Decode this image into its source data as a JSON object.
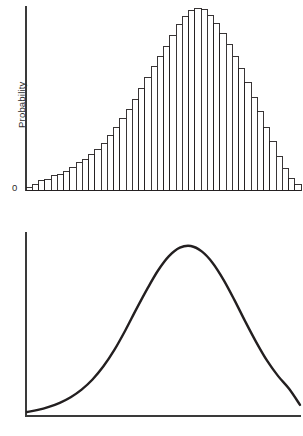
{
  "figure": {
    "background": "#ffffff",
    "ink": "#231f20",
    "panels": [
      {
        "id": "histogram",
        "ylabel": "Probability",
        "origin_label": "0"
      },
      {
        "id": "curve",
        "ylabel": "Probability",
        "origin_label": "0"
      }
    ]
  },
  "chart_data": [
    {
      "type": "bar",
      "title": "",
      "xlabel": "",
      "ylabel": "Probability",
      "grid": false,
      "legend": null,
      "axis": {
        "x_axis_visible": true,
        "y_axis_visible": true,
        "y_tick_labels": [
          "0"
        ],
        "x_tick_labels": []
      },
      "ylim": [
        0,
        1.0
      ],
      "categories": [
        "1",
        "2",
        "3",
        "4",
        "5",
        "6",
        "7",
        "8",
        "9",
        "10",
        "11",
        "12",
        "13",
        "14",
        "15",
        "16",
        "17",
        "18",
        "19",
        "20",
        "21",
        "22",
        "23",
        "24",
        "25",
        "26",
        "27",
        "28",
        "29",
        "30",
        "31",
        "32",
        "33",
        "34",
        "35",
        "36",
        "37",
        "38",
        "39",
        "40",
        "41",
        "42",
        "43",
        "44"
      ],
      "values": [
        0.012,
        0.03,
        0.05,
        0.06,
        0.078,
        0.085,
        0.1,
        0.125,
        0.15,
        0.165,
        0.195,
        0.225,
        0.258,
        0.3,
        0.345,
        0.395,
        0.445,
        0.5,
        0.56,
        0.62,
        0.68,
        0.735,
        0.79,
        0.85,
        0.91,
        0.955,
        0.985,
        1.0,
        0.99,
        0.96,
        0.915,
        0.86,
        0.8,
        0.735,
        0.665,
        0.59,
        0.51,
        0.43,
        0.345,
        0.265,
        0.185,
        0.12,
        0.065,
        0.028
      ]
    },
    {
      "type": "line",
      "title": "",
      "xlabel": "",
      "ylabel": "Probability",
      "grid": false,
      "legend": null,
      "axis": {
        "x_axis_visible": true,
        "y_axis_visible": true,
        "y_tick_labels": [
          "0"
        ],
        "x_tick_labels": []
      },
      "ylim": [
        0,
        1.0
      ],
      "x": [
        0.0,
        0.04,
        0.08,
        0.12,
        0.16,
        0.2,
        0.24,
        0.28,
        0.32,
        0.36,
        0.4,
        0.44,
        0.48,
        0.52,
        0.56,
        0.6,
        0.64,
        0.68,
        0.72,
        0.76,
        0.8,
        0.84,
        0.88,
        0.92,
        0.96,
        1.0
      ],
      "y": [
        0.018,
        0.03,
        0.048,
        0.072,
        0.105,
        0.15,
        0.21,
        0.288,
        0.385,
        0.5,
        0.625,
        0.745,
        0.855,
        0.94,
        0.99,
        1.0,
        0.968,
        0.9,
        0.8,
        0.68,
        0.552,
        0.43,
        0.32,
        0.23,
        0.155,
        0.06
      ]
    }
  ]
}
